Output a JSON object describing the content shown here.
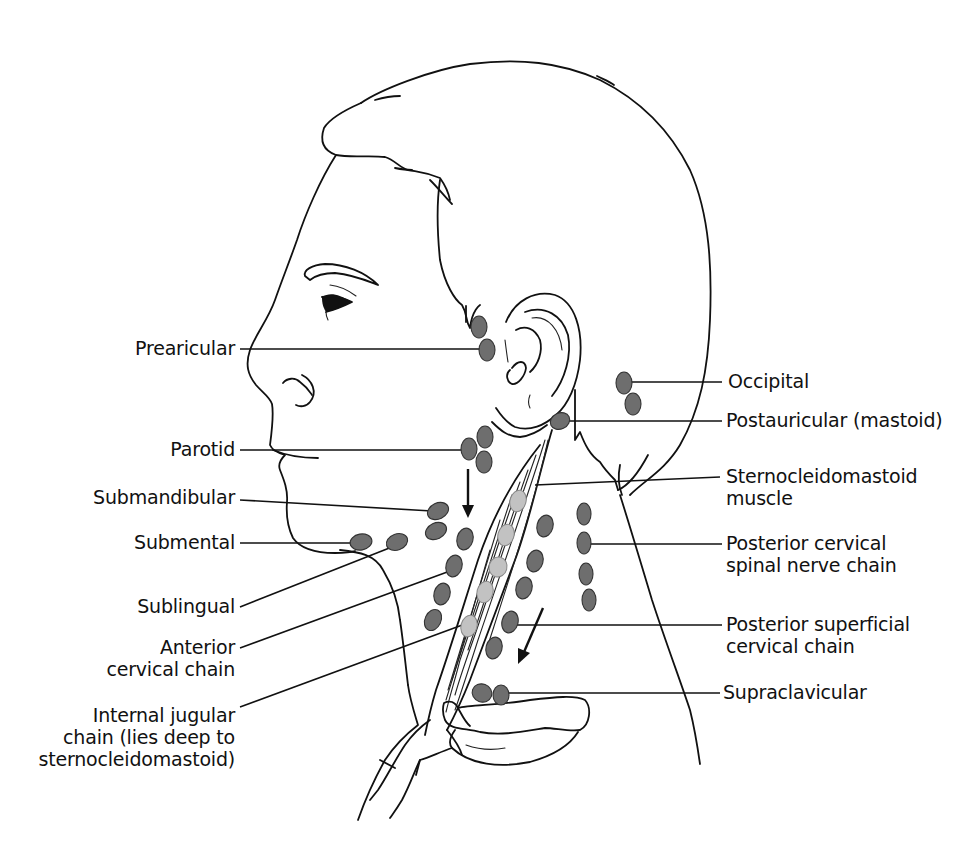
{
  "figure": {
    "colors": {
      "line": "#111111",
      "superficial_node_fill": "#6e6e6e",
      "deep_node_fill": "#c2c2c2",
      "background": "#ffffff"
    }
  },
  "labels_left": [
    {
      "id": "prearicular",
      "lines": [
        "Prearicular"
      ]
    },
    {
      "id": "parotid",
      "lines": [
        "Parotid"
      ]
    },
    {
      "id": "submandibular",
      "lines": [
        "Submandibular"
      ]
    },
    {
      "id": "submental",
      "lines": [
        "Submental"
      ]
    },
    {
      "id": "sublingual",
      "lines": [
        "Sublingual"
      ]
    },
    {
      "id": "anterior-cervical-chain",
      "lines": [
        "Anterior",
        "cervical chain"
      ]
    },
    {
      "id": "internal-jugular-chain",
      "lines": [
        "Internal jugular",
        "chain (lies deep to",
        "sternocleidomastoid)"
      ]
    }
  ],
  "labels_right": [
    {
      "id": "occipital",
      "lines": [
        "Occipital"
      ]
    },
    {
      "id": "postauricular",
      "lines": [
        "Postauricular (mastoid)"
      ]
    },
    {
      "id": "sternocleidomastoid-muscle",
      "lines": [
        "Sternocleidomastoid",
        "muscle"
      ]
    },
    {
      "id": "posterior-cervical-spinal-nerve-chain",
      "lines": [
        "Posterior cervical",
        "spinal nerve chain"
      ]
    },
    {
      "id": "posterior-superficial-cervical-chain",
      "lines": [
        "Posterior superficial",
        "cervical chain"
      ]
    },
    {
      "id": "supraclavicular",
      "lines": [
        "Supraclavicular"
      ]
    }
  ],
  "annotations": {
    "drainage_arrows": [
      "downward arrow below parotid nodes",
      "down-left arrow along posterior superficial chain"
    ]
  }
}
